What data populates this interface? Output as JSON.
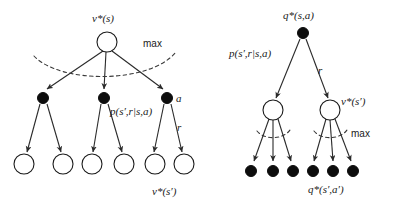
{
  "figure": {
    "background_color": "#ffffff",
    "ink_color": "#1a1a1a",
    "node_fill_open": "#ffffff",
    "node_fill_solid": "#0d0d0d"
  },
  "left_diagram": {
    "name": "v-star-backup-diagram",
    "root_label": {
      "base": "v",
      "star": "*",
      "args": "(s)"
    },
    "root_label_text": "v*(s)",
    "max_label": "max",
    "transition_label": "p(s′,r|s,a)",
    "action_label": "a",
    "reward_label": "r",
    "leaf_label": "v*(s′)",
    "root_node": {
      "type": "open-circle",
      "cx": 107,
      "cy": 42,
      "r": 10
    },
    "middle_nodes": [
      {
        "type": "filled-circle",
        "cx": 43,
        "cy": 98,
        "r": 5.5
      },
      {
        "type": "filled-circle",
        "cx": 104,
        "cy": 98,
        "r": 5.5
      },
      {
        "type": "filled-circle",
        "cx": 167,
        "cy": 98,
        "r": 5.5
      }
    ],
    "leaf_nodes": [
      {
        "type": "open-circle",
        "cx": 24,
        "cy": 164,
        "r": 10
      },
      {
        "type": "open-circle",
        "cx": 63,
        "cy": 164,
        "r": 10
      },
      {
        "type": "open-circle",
        "cx": 92,
        "cy": 164,
        "r": 10
      },
      {
        "type": "open-circle",
        "cx": 124,
        "cy": 164,
        "r": 10
      },
      {
        "type": "open-circle",
        "cx": 155,
        "cy": 164,
        "r": 10
      },
      {
        "type": "open-circle",
        "cx": 184,
        "cy": 164,
        "r": 10
      }
    ]
  },
  "right_diagram": {
    "name": "q-star-backup-diagram",
    "root_label_text": "q*(s,a)",
    "transition_label": "p(s′,r|s,a)",
    "reward_label": "r",
    "state_value_label": "v*(s′)",
    "max_label": "max",
    "leaf_label": "q*(s′,a′)",
    "root_node": {
      "type": "filled-circle",
      "cx": 303,
      "cy": 33,
      "r": 5.5
    },
    "middle_nodes": [
      {
        "type": "open-circle",
        "cx": 273,
        "cy": 110,
        "r": 10
      },
      {
        "type": "open-circle",
        "cx": 330,
        "cy": 110,
        "r": 10
      }
    ],
    "leaf_nodes": [
      {
        "type": "filled-circle",
        "cx": 251,
        "cy": 171,
        "r": 5.5
      },
      {
        "type": "filled-circle",
        "cx": 273,
        "cy": 171,
        "r": 5.5
      },
      {
        "type": "filled-circle",
        "cx": 293,
        "cy": 171,
        "r": 5.5
      },
      {
        "type": "filled-circle",
        "cx": 313,
        "cy": 171,
        "r": 5.5
      },
      {
        "type": "filled-circle",
        "cx": 333,
        "cy": 171,
        "r": 5.5
      },
      {
        "type": "filled-circle",
        "cx": 353,
        "cy": 171,
        "r": 5.5
      }
    ]
  }
}
